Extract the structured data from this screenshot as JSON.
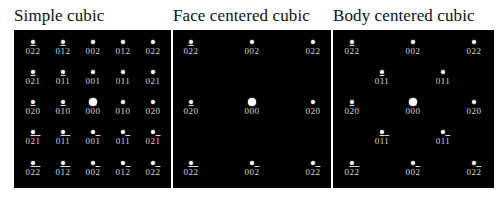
{
  "panels": [
    {
      "title": "Simple cubic",
      "x": 14,
      "width": 157,
      "spots": [
        {
          "x": 19,
          "y": 12,
          "h": "0",
          "k": "2̄",
          "l": "2",
          "label": "0 -2 2",
          "big": false
        },
        {
          "x": 49,
          "y": 12,
          "label": "0 -1 2",
          "big": false
        },
        {
          "x": 79,
          "y": 12,
          "label": "0 0 2",
          "big": false
        },
        {
          "x": 109,
          "y": 12,
          "label": "0 1 2",
          "big": false
        },
        {
          "x": 139,
          "y": 12,
          "label": "0 2 2",
          "big": false
        },
        {
          "x": 19,
          "y": 42,
          "label": "0 -2 1",
          "big": false
        },
        {
          "x": 49,
          "y": 42,
          "label": "0 -1 1",
          "big": false
        },
        {
          "x": 79,
          "y": 42,
          "label": "0 0 1",
          "big": false
        },
        {
          "x": 109,
          "y": 42,
          "label": "0 1 1",
          "big": false
        },
        {
          "x": 139,
          "y": 42,
          "label": "0 2 1",
          "big": false
        },
        {
          "x": 19,
          "y": 72,
          "label": "0 -2 0",
          "big": false
        },
        {
          "x": 49,
          "y": 72,
          "label": "0 -1 0",
          "big": false
        },
        {
          "x": 79,
          "y": 72,
          "label": "0 0 0",
          "big": true
        },
        {
          "x": 109,
          "y": 72,
          "label": "0 1 0",
          "big": false
        },
        {
          "x": 139,
          "y": 72,
          "label": "0 2 0",
          "big": false
        },
        {
          "x": 19,
          "y": 102,
          "label": "0 -2 -1",
          "big": false
        },
        {
          "x": 49,
          "y": 102,
          "label": "0 -1 -1",
          "big": false
        },
        {
          "x": 79,
          "y": 102,
          "label": "0 0 -1",
          "big": false
        },
        {
          "x": 109,
          "y": 102,
          "label": "0 1 -1",
          "big": false
        },
        {
          "x": 139,
          "y": 102,
          "label": "0 2 -1",
          "big": false
        },
        {
          "x": 19,
          "y": 133,
          "label": "0 -2 -2",
          "big": false
        },
        {
          "x": 49,
          "y": 133,
          "label": "0 -1 -2",
          "big": false
        },
        {
          "x": 79,
          "y": 133,
          "label": "0 0 -2",
          "big": false
        },
        {
          "x": 109,
          "y": 133,
          "label": "0 1 -2",
          "big": false
        },
        {
          "x": 139,
          "y": 133,
          "label": "0 2 -2",
          "big": false
        }
      ]
    },
    {
      "title": "Face centered cubic",
      "x": 173,
      "width": 158,
      "spots": [
        {
          "x": 18,
          "y": 12,
          "label": "0 -2 2",
          "big": false
        },
        {
          "x": 79,
          "y": 12,
          "label": "0 0 2",
          "big": false
        },
        {
          "x": 140,
          "y": 12,
          "label": "0 2 2",
          "big": false
        },
        {
          "x": 18,
          "y": 72,
          "label": "0 -2 0",
          "big": false
        },
        {
          "x": 79,
          "y": 72,
          "label": "0 0 0",
          "big": true
        },
        {
          "x": 140,
          "y": 72,
          "label": "0 2 0",
          "big": false
        },
        {
          "x": 18,
          "y": 133,
          "label": "0 -2 -2",
          "big": false
        },
        {
          "x": 79,
          "y": 133,
          "label": "0 0 -2",
          "big": false
        },
        {
          "x": 140,
          "y": 133,
          "label": "0 2 -2",
          "big": false
        }
      ]
    },
    {
      "title": "Body centered cubic",
      "x": 333,
      "width": 161,
      "spots": [
        {
          "x": 19,
          "y": 12,
          "label": "0 -2 2",
          "big": false
        },
        {
          "x": 80,
          "y": 12,
          "label": "0 0 2",
          "big": false
        },
        {
          "x": 141,
          "y": 12,
          "label": "0 2 2",
          "big": false
        },
        {
          "x": 49,
          "y": 42,
          "label": "0 -1 1",
          "big": false
        },
        {
          "x": 110,
          "y": 42,
          "label": "0 1 1",
          "big": false
        },
        {
          "x": 19,
          "y": 72,
          "label": "0 -2 0",
          "big": false
        },
        {
          "x": 80,
          "y": 72,
          "label": "0 0 0",
          "big": true
        },
        {
          "x": 141,
          "y": 72,
          "label": "0 2 0",
          "big": false
        },
        {
          "x": 49,
          "y": 102,
          "label": "0 -1 -1",
          "big": false
        },
        {
          "x": 110,
          "y": 102,
          "label": "0 1 -1",
          "big": false
        },
        {
          "x": 19,
          "y": 133,
          "label": "0 -2 -2",
          "big": false
        },
        {
          "x": 80,
          "y": 133,
          "label": "0 0 -2",
          "big": false
        },
        {
          "x": 141,
          "y": 133,
          "label": "0 2 -2",
          "big": false
        }
      ]
    }
  ],
  "colors": {
    "panel_bg": "#000000",
    "spot": "#ffffff",
    "label": "#d8d8d8",
    "title": "#111111"
  }
}
